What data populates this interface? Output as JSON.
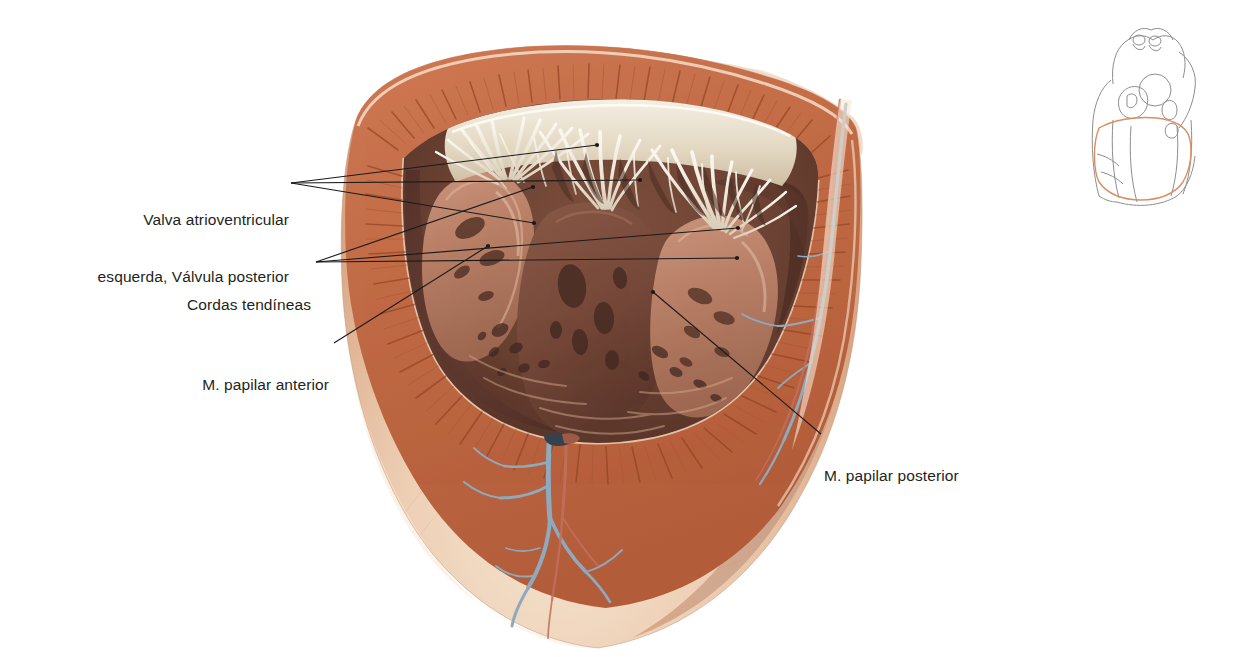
{
  "figure": {
    "type": "anatomical-illustration",
    "background_color": "#ffffff",
    "label_text_color": "#231f20",
    "leader_line_color": "#1a1a1a",
    "palette": {
      "epicardium": "#e8b79b",
      "epicardium_light": "#f2d7c2",
      "myocardium": "#c9714d",
      "myocardium_dark": "#a9512f",
      "endocardium_cavity": "#6e4234",
      "cavity_dark": "#573227",
      "chordae_white": "#f3efe6",
      "valve_cusp": "#e4d9c6",
      "vein_blue": "#8fa9bd",
      "artery_red": "#c2705e",
      "thumb_outline": "#8a8a8a",
      "thumb_highlight": "#d98f63"
    }
  },
  "labels": [
    {
      "id": "valva-atrioventricular-esquerda",
      "lines": [
        "Valva atrioventricular",
        "esquerda, Válvula posterior"
      ],
      "align": "right",
      "x": 289,
      "y": 172
    },
    {
      "id": "cordas-tendineas",
      "lines": [
        "Cordas tendíneas"
      ],
      "align": "right",
      "x": 311,
      "y": 257
    },
    {
      "id": "m-papilar-anterior",
      "lines": [
        "M. papilar anterior"
      ],
      "align": "right",
      "x": 329,
      "y": 337
    },
    {
      "id": "m-papilar-posterior",
      "lines": [
        "M. papilar posterior"
      ],
      "align": "left",
      "x": 824,
      "y": 428
    }
  ],
  "leader_lines": [
    {
      "id": "leader-valva-1",
      "from": [
        291,
        183
      ],
      "to": [
        597,
        145
      ],
      "dot": true
    },
    {
      "id": "leader-valva-2",
      "from": [
        291,
        183
      ],
      "to": [
        534,
        223
      ],
      "dot": true
    },
    {
      "id": "leader-valva-3",
      "from": [
        291,
        183
      ],
      "to": [
        640,
        180
      ],
      "dot": true
    },
    {
      "id": "leader-cordas-1",
      "from": [
        316,
        262
      ],
      "to": [
        533,
        187
      ],
      "dot": true
    },
    {
      "id": "leader-cordas-2",
      "from": [
        316,
        262
      ],
      "to": [
        738,
        228
      ],
      "dot": true
    },
    {
      "id": "leader-cordas-3",
      "from": [
        316,
        262
      ],
      "to": [
        737,
        258
      ],
      "dot": true
    },
    {
      "id": "leader-papilar-anterior",
      "from": [
        334,
        343
      ],
      "to": [
        488,
        246
      ],
      "dot": true
    },
    {
      "id": "leader-papilar-posterior",
      "from": [
        821,
        434
      ],
      "to": [
        653,
        292
      ],
      "dot": true
    }
  ],
  "thumbnail": {
    "id": "orientation-heart-thumbnail",
    "description": "Esquema do coração com plano de secção realçado",
    "x": 1083,
    "y": 22,
    "width": 124,
    "height": 188,
    "highlight_color": "#d98f63"
  },
  "anatomy_regions": [
    {
      "id": "epicardium-outer-wall",
      "label": "Epicárdio"
    },
    {
      "id": "myocardium-ring",
      "label": "Miocárdio"
    },
    {
      "id": "ventricular-cavity",
      "label": "Cavidade do ventrículo esquerdo"
    },
    {
      "id": "chordae-tendineae-fan",
      "label": "Cordas tendíneas"
    },
    {
      "id": "posterior-cusp",
      "label": "Válvula posterior"
    },
    {
      "id": "anterior-papillary-muscle",
      "label": "M. papilar anterior"
    },
    {
      "id": "posterior-papillary-muscle",
      "label": "M. papilar posterior"
    },
    {
      "id": "apex-coronary-vessels",
      "label": "Vasos coronários no ápice"
    },
    {
      "id": "right-margin-coronary-vessels",
      "label": "Vasos coronários na margem"
    }
  ]
}
